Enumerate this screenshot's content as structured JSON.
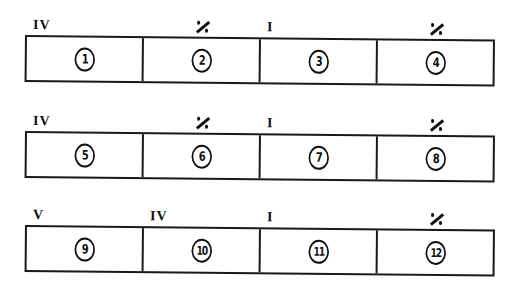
{
  "rows": [
    {
      "measures": [
        {
          "chord": "IV",
          "chord_type": "roman",
          "number": "1"
        },
        {
          "chord": "%",
          "chord_type": "repeat",
          "number": "2"
        },
        {
          "chord": "I",
          "chord_type": "roman",
          "number": "3"
        },
        {
          "chord": "%",
          "chord_type": "repeat",
          "number": "4"
        }
      ]
    },
    {
      "measures": [
        {
          "chord": "IV",
          "chord_type": "roman",
          "number": "5"
        },
        {
          "chord": "%",
          "chord_type": "repeat",
          "number": "6"
        },
        {
          "chord": "I",
          "chord_type": "roman",
          "number": "7"
        },
        {
          "chord": "%",
          "chord_type": "repeat",
          "number": "8"
        }
      ]
    },
    {
      "measures": [
        {
          "chord": "V",
          "chord_type": "roman",
          "number": "9"
        },
        {
          "chord": "IV",
          "chord_type": "roman",
          "number": "10"
        },
        {
          "chord": "I",
          "chord_type": "roman",
          "number": "11"
        },
        {
          "chord": "%",
          "chord_type": "repeat",
          "number": "12"
        }
      ]
    }
  ],
  "icons": {
    "repeat": "measure-repeat-sign",
    "measure_number": "circled-number"
  },
  "colors": {
    "ink": "#111111",
    "paper": "#ffffff"
  }
}
